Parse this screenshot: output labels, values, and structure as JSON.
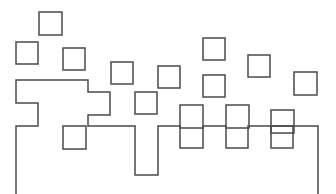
{
  "figure": {
    "title": "",
    "background_color": "#ffffff",
    "stroke_color": "#4a4a4a",
    "stroke_width": 1.5,
    "width": 336,
    "height": 194
  },
  "chart_data": {
    "type": "scatter",
    "title": "",
    "xlabel": "",
    "ylabel": "",
    "xlim": [
      0,
      336
    ],
    "ylim": [
      0,
      194
    ],
    "grid": false,
    "legend": "none",
    "squares": [
      {
        "id": "sq-1",
        "x": 39,
        "y": 12,
        "size": 23
      },
      {
        "id": "sq-2",
        "x": 16,
        "y": 42,
        "size": 22
      },
      {
        "id": "sq-3",
        "x": 63,
        "y": 48,
        "size": 22
      },
      {
        "id": "sq-4",
        "x": 111,
        "y": 62,
        "size": 22
      },
      {
        "id": "sq-5",
        "x": 158,
        "y": 66,
        "size": 22
      },
      {
        "id": "sq-6",
        "x": 135,
        "y": 92,
        "size": 22
      },
      {
        "id": "sq-7",
        "x": 203,
        "y": 38,
        "size": 22
      },
      {
        "id": "sq-8",
        "x": 203,
        "y": 75,
        "size": 22
      },
      {
        "id": "sq-9",
        "x": 248,
        "y": 55,
        "size": 22
      },
      {
        "id": "sq-10",
        "x": 294,
        "y": 72,
        "size": 23
      },
      {
        "id": "sq-11",
        "x": 180,
        "y": 105,
        "size": 23
      },
      {
        "id": "sq-12",
        "x": 226,
        "y": 105,
        "size": 23
      },
      {
        "id": "sq-13",
        "x": 271,
        "y": 110,
        "size": 23
      },
      {
        "id": "sq-14",
        "x": 271,
        "y": 126,
        "size": 22
      },
      {
        "id": "sq-15",
        "x": 63,
        "y": 126,
        "size": 23
      }
    ],
    "polyline_points": "16,194 16,126 38,126 38,103 16,103 16,80 88,80 88,92 110,92 110,115 88,115 88,126 135,126 135,175 158,175 158,126 180,126 180,148 203,148 203,126 226,126 226,148 248,148 248,126 318,126 318,194"
  }
}
